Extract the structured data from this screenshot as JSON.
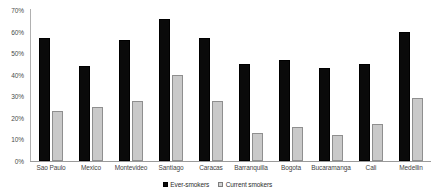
{
  "chart_data": {
    "type": "bar",
    "title": "",
    "xlabel": "",
    "ylabel": "",
    "ylim": [
      0,
      70
    ],
    "ytick_labels": [
      "70%",
      "60%",
      "50%",
      "40%",
      "30%",
      "20%",
      "10%",
      "0%"
    ],
    "ytick_values": [
      70,
      60,
      50,
      40,
      30,
      20,
      10,
      0
    ],
    "grid": false,
    "legend_position": "bottom-center",
    "categories": [
      "Sao Paulo",
      "Mexico",
      "Montevideo",
      "Santiago",
      "Caracas",
      "Barranquilla",
      "Bogota",
      "Bucaramanga",
      "Cali",
      "Medellin"
    ],
    "series": [
      {
        "name": "Ever-smokers",
        "color": "#0a0a0a",
        "values": [
          57,
          44,
          56,
          66,
          57,
          45,
          47,
          43,
          45,
          60
        ]
      },
      {
        "name": "Current smokers",
        "color": "#c9c9c9",
        "values": [
          23,
          25,
          28,
          40,
          28,
          13,
          16,
          12,
          17,
          29
        ]
      }
    ]
  },
  "legend": {
    "items": [
      {
        "label": "Ever-smokers",
        "swatch": "ever"
      },
      {
        "label": "Current smokers",
        "swatch": "current"
      }
    ]
  }
}
